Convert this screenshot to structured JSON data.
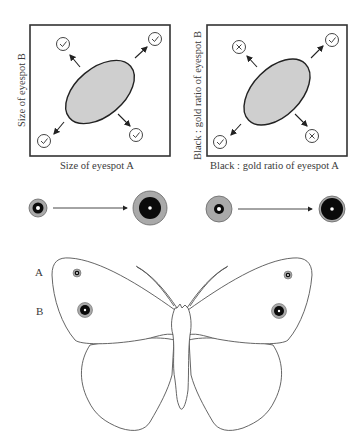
{
  "panels": [
    {
      "id": "size",
      "xlabel": "Size of eyespot A",
      "ylabel": "Size of eyespot B",
      "corners": {
        "top_left": "check",
        "top_right": "check",
        "bottom_left": "check",
        "bottom_right": "check"
      }
    },
    {
      "id": "ratio",
      "xlabel": "Black : gold ratio of eyespot A",
      "ylabel": "Black : gold ratio of eyespot B",
      "corners": {
        "top_left": "cross",
        "top_right": "check",
        "bottom_left": "check",
        "bottom_right": "cross"
      }
    }
  ],
  "transitions": [
    {
      "from": "small eyespot",
      "to": "large eyespot"
    },
    {
      "from": "mostly gold eyespot",
      "to": "mostly black eyespot"
    }
  ],
  "butterfly": {
    "labels": {
      "A": "A",
      "B": "B"
    }
  },
  "colors": {
    "ellipse_fill": "#cfcfcf",
    "gold_ring": "#a9a9a9",
    "black": "#0a0a0a",
    "line": "#555555"
  }
}
